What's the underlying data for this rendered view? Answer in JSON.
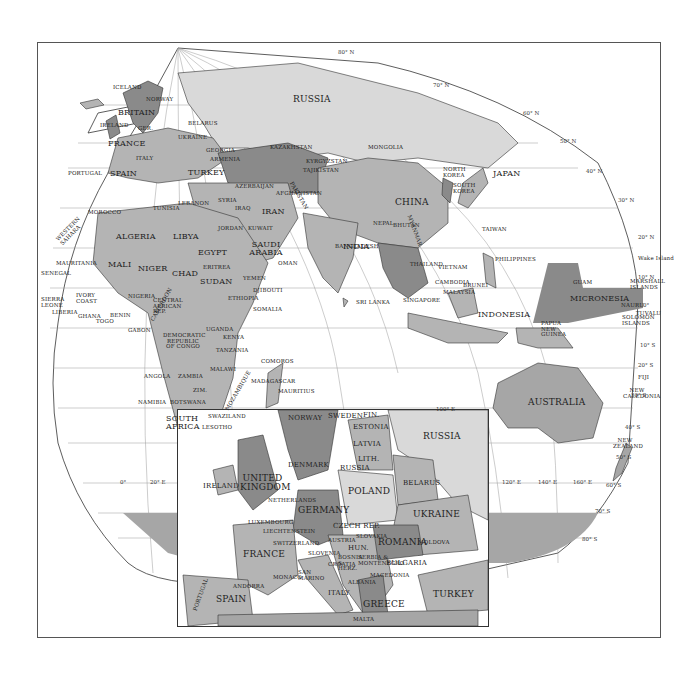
{
  "map": {
    "projection": "interrupted world map with Europe inset",
    "colors": {
      "land_light": "#d9d9d9",
      "land_mid": "#b4b4b4",
      "land_dark": "#8a8a8a",
      "water": "#ffffff",
      "border": "#222222",
      "grid": "#9a9a9a",
      "frame": "#555555"
    },
    "latitude_labels": [
      "80° N",
      "70° N",
      "60° N",
      "50° N",
      "40° N",
      "30° N",
      "20° N",
      "10° N",
      "0°",
      "10° S",
      "20° S",
      "30° S",
      "40° S",
      "50° S",
      "60° S",
      "70° S",
      "80° S"
    ],
    "longitude_labels": [
      "0°",
      "20° E",
      "100° E",
      "120° E",
      "140° E",
      "160° E"
    ],
    "world_labels": {
      "russia": "RUSSIA",
      "iceland": "ICELAND",
      "norway": "NORWAY",
      "britain": "BRITAIN",
      "ireland": "IRELAND",
      "france": "FRANCE",
      "germany": "GER.",
      "poland": "POLAND",
      "belarus": "BELARUS",
      "ukraine": "UKRAINE",
      "romania": "ROMANIA",
      "italy": "ITALY",
      "greece": "GREECE",
      "portugal": "PORTUGAL",
      "spain": "SPAIN",
      "turkey": "TURKEY",
      "georgia": "GEORGIA",
      "armenia": "ARMENIA",
      "azerbaijan": "AZERBAIJAN",
      "kazakhstan": "KAZAKHSTAN",
      "uzbekistan": "UZBEKISTAN",
      "turkmenistan": "TURKMENISTAN",
      "kyrgyzstan": "KYRGYZSTAN",
      "tajikistan": "TAJIKISTAN",
      "mongolia": "MONGOLIA",
      "china": "CHINA",
      "north_korea": "NORTH KOREA",
      "south_korea": "SOUTH KOREA",
      "japan": "JAPAN",
      "taiwan": "TAIWAN",
      "philippines": "PHILIPPINES",
      "vietnam": "VIETNAM",
      "thailand": "THAILAND",
      "cambodia": "CAMBODIA",
      "myanmar": "MYANMAR",
      "malaysia": "MALAYSIA",
      "brunei": "BRUNEI",
      "singapore": "SINGAPORE",
      "indonesia": "INDONESIA",
      "papua_new_guinea": "PAPUA NEW GUINEA",
      "india": "INDIA",
      "nepal": "NEPAL",
      "bhutan": "BHUTAN",
      "bangladesh": "BANGLADESH",
      "sri_lanka": "SRI LANKA",
      "pakistan": "PAKISTAN",
      "afghanistan": "AFGHANISTAN",
      "iran": "IRAN",
      "iraq": "IRAQ",
      "syria": "SYRIA",
      "lebanon": "LEBANON",
      "israel": "ISRAEL",
      "jordan": "JORDAN",
      "kuwait": "KUWAIT",
      "saudi_arabia": "SAUDI ARABIA",
      "yemen": "YEMEN",
      "oman": "OMAN",
      "djibouti": "DJIBOUTI",
      "morocco": "MOROCCO",
      "western_sahara": "WESTERN SAHARA",
      "algeria": "ALGERIA",
      "tunisia": "TUNISIA",
      "libya": "LIBYA",
      "egypt": "EGYPT",
      "mauritania": "MAURITANIA",
      "mali": "MALI",
      "niger": "NIGER",
      "chad": "CHAD",
      "sudan": "SUDAN",
      "eritrea": "ERITREA",
      "ethiopia": "ETHIOPIA",
      "somalia": "SOMALIA",
      "senegal": "SENEGAL",
      "sierra_leone": "SIERRA LEONE",
      "liberia": "LIBERIA",
      "ivory_coast": "IVORY COAST",
      "ghana": "GHANA",
      "togo": "TOGO",
      "benin": "BENIN",
      "nigeria": "NIGERIA",
      "cameroon": "CAMEROON",
      "central_african_rep": "CENTRAL AFRICAN REP.",
      "gabon": "GABON",
      "congo": "DEMOCRATIC REPUBLIC OF CONGO",
      "uganda": "UGANDA",
      "kenya": "KENYA",
      "tanzania": "TANZANIA",
      "angola": "ANGOLA",
      "zambia": "ZAMBIA",
      "malawi": "MALAWI",
      "mozambique": "MOZAMBIQUE",
      "zimbabwe": "ZIM.",
      "namibia": "NAMIBIA",
      "botswana": "BOTSWANA",
      "south_africa": "SOUTH AFRICA",
      "swaziland": "SWAZILAND",
      "lesotho": "LESOTHO",
      "comoros": "COMOROS",
      "madagascar": "MADAGASCAR",
      "mauritius": "MAURITIUS",
      "australia": "AUSTRALIA",
      "new_zealand": "NEW ZEALAND",
      "new_caledonia": "NEW CALEDONIA",
      "fiji": "FIJI",
      "tuvalu": "TUVALU",
      "nauru": "NAURU",
      "solomon_islands": "SOLOMON ISLANDS",
      "micronesia": "MICRONESIA",
      "guam": "GUAM",
      "marshall_islands": "MARSHALL ISLANDS",
      "wake_island": "Wake Island"
    },
    "inset_labels": {
      "norway": "NORWAY",
      "sweden": "SWEDEN",
      "finland": "FIN.",
      "estonia": "ESTONIA",
      "latvia": "LATVIA",
      "lithuania": "LITH.",
      "russia_kaliningrad": "RUSSIA",
      "russia": "RUSSIA",
      "denmark": "DENMARK",
      "united_kingdom": "UNITED KINGDOM",
      "ireland": "IRELAND",
      "netherlands": "NETHERLANDS",
      "belgium": "BELGIUM",
      "luxembourg": "LUXEMBOURG",
      "liechtenstein": "LIECHTENSTEIN",
      "germany": "GERMANY",
      "poland": "POLAND",
      "belarus": "BELARUS",
      "ukraine": "UKRAINE",
      "czech_rep": "CZECH REP.",
      "slovakia": "SLOVAKIA",
      "austria": "AUSTRIA",
      "hungary": "HUN.",
      "switzerland": "SWITZERLAND",
      "slovenia": "SLOVENIA",
      "croatia": "CROATIA",
      "bosnia": "BOSNIA & HERZ.",
      "serbia": "SERBIA & MONTENEGRO",
      "romania": "ROMANIA",
      "moldova": "MOLDOVA",
      "bulgaria": "BULGARIA",
      "macedonia": "MACEDONIA",
      "albania": "ALBANIA",
      "greece": "GREECE",
      "turkey": "TURKEY",
      "france": "FRANCE",
      "monaco": "MONACO",
      "san_marino": "SAN MARINO",
      "italy": "ITALY",
      "andorra": "ANDORRA",
      "spain": "SPAIN",
      "portugal": "PORTUGAL",
      "malta": "MALTA"
    }
  }
}
